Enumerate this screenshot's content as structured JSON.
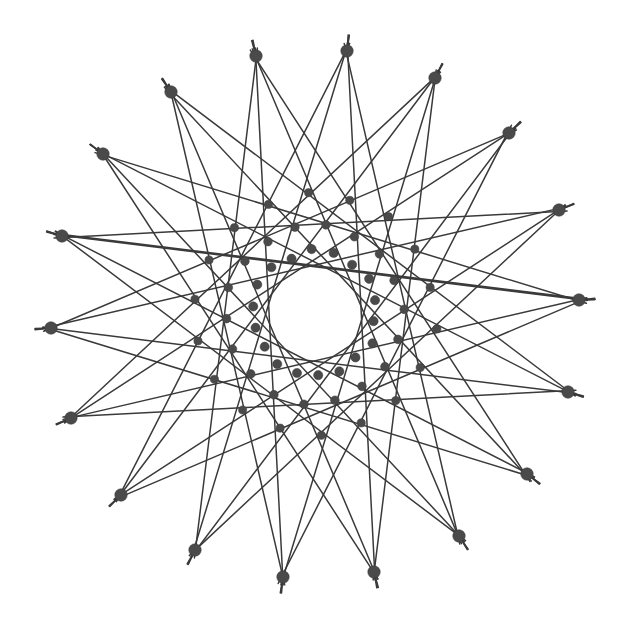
{
  "figure": {
    "type": "geometric-line-figure",
    "background_color": "#ffffff",
    "line_color": "#3a3a3a",
    "node_color": "#4a4a4a",
    "canvas": {
      "width": 627,
      "height": 627
    }
  },
  "chart_data": {
    "type": "scatter",
    "subtitle": "",
    "xlabel": "",
    "ylabel": "",
    "xlim": [
      0,
      627
    ],
    "ylim": [
      0,
      627
    ],
    "grid": false,
    "legend": "none",
    "annotations": [],
    "geometry": {
      "center_x": 315,
      "center_y": 314,
      "outer_radius": 265,
      "inner_ring_radius": 62,
      "node_count": 18,
      "angular_step_deg": 20,
      "start_angle_deg": -3,
      "chord_steps": [
        7,
        8
      ],
      "tail_length": 16,
      "outer_node_radius": 6.2,
      "inner_node_radius": 4.6,
      "line_width_thin": 1.5,
      "line_width_thick": 2.6
    },
    "outer_nodes": [
      {
        "index": 0,
        "angle_deg": -3,
        "x": 579,
        "y": 300
      },
      {
        "index": 1,
        "angle_deg": 17,
        "x": 568,
        "y": 392
      },
      {
        "index": 2,
        "angle_deg": 37,
        "x": 527,
        "y": 474
      },
      {
        "index": 3,
        "angle_deg": 57,
        "x": 459,
        "y": 536
      },
      {
        "index": 4,
        "angle_deg": 77,
        "x": 374,
        "y": 572
      },
      {
        "index": 5,
        "angle_deg": 97,
        "x": 283,
        "y": 577
      },
      {
        "index": 6,
        "angle_deg": 117,
        "x": 195,
        "y": 550
      },
      {
        "index": 7,
        "angle_deg": 137,
        "x": 121,
        "y": 495
      },
      {
        "index": 8,
        "angle_deg": 157,
        "x": 71,
        "y": 418
      },
      {
        "index": 9,
        "angle_deg": 177,
        "x": 51,
        "y": 328
      },
      {
        "index": 10,
        "angle_deg": 197,
        "x": 62,
        "y": 236
      },
      {
        "index": 11,
        "angle_deg": 217,
        "x": 103,
        "y": 154
      },
      {
        "index": 12,
        "angle_deg": 237,
        "x": 171,
        "y": 92
      },
      {
        "index": 13,
        "angle_deg": 257,
        "x": 256,
        "y": 56
      },
      {
        "index": 14,
        "angle_deg": 277,
        "x": 347,
        "y": 51
      },
      {
        "index": 15,
        "angle_deg": 297,
        "x": 435,
        "y": 78
      },
      {
        "index": 16,
        "angle_deg": 317,
        "x": 509,
        "y": 133
      },
      {
        "index": 17,
        "angle_deg": 337,
        "x": 559,
        "y": 210
      }
    ],
    "edges": [
      {
        "from": 0,
        "to": 7,
        "weight": 1
      },
      {
        "from": 1,
        "to": 8,
        "weight": 1
      },
      {
        "from": 2,
        "to": 9,
        "weight": 1
      },
      {
        "from": 3,
        "to": 10,
        "weight": 1
      },
      {
        "from": 4,
        "to": 11,
        "weight": 1
      },
      {
        "from": 5,
        "to": 12,
        "weight": 1
      },
      {
        "from": 6,
        "to": 13,
        "weight": 1
      },
      {
        "from": 7,
        "to": 14,
        "weight": 1
      },
      {
        "from": 8,
        "to": 15,
        "weight": 1
      },
      {
        "from": 9,
        "to": 16,
        "weight": 1
      },
      {
        "from": 10,
        "to": 17,
        "weight": 1
      },
      {
        "from": 11,
        "to": 0,
        "weight": 1
      },
      {
        "from": 12,
        "to": 1,
        "weight": 1
      },
      {
        "from": 13,
        "to": 2,
        "weight": 1
      },
      {
        "from": 14,
        "to": 3,
        "weight": 1
      },
      {
        "from": 15,
        "to": 4,
        "weight": 1
      },
      {
        "from": 16,
        "to": 5,
        "weight": 1
      },
      {
        "from": 17,
        "to": 6,
        "weight": 1
      },
      {
        "from": 0,
        "to": 8,
        "weight": 1
      },
      {
        "from": 1,
        "to": 9,
        "weight": 1
      },
      {
        "from": 2,
        "to": 10,
        "weight": 1
      },
      {
        "from": 3,
        "to": 11,
        "weight": 1
      },
      {
        "from": 4,
        "to": 12,
        "weight": 1
      },
      {
        "from": 5,
        "to": 13,
        "weight": 1
      },
      {
        "from": 6,
        "to": 14,
        "weight": 1
      },
      {
        "from": 7,
        "to": 15,
        "weight": 1
      },
      {
        "from": 8,
        "to": 16,
        "weight": 1
      },
      {
        "from": 9,
        "to": 17,
        "weight": 1
      },
      {
        "from": 10,
        "to": 0,
        "weight": 2
      },
      {
        "from": 11,
        "to": 1,
        "weight": 1
      },
      {
        "from": 12,
        "to": 2,
        "weight": 1
      },
      {
        "from": 13,
        "to": 3,
        "weight": 1
      },
      {
        "from": 14,
        "to": 4,
        "weight": 1
      },
      {
        "from": 15,
        "to": 5,
        "weight": 1
      },
      {
        "from": 16,
        "to": 6,
        "weight": 1
      },
      {
        "from": 17,
        "to": 7,
        "weight": 1
      }
    ]
  }
}
